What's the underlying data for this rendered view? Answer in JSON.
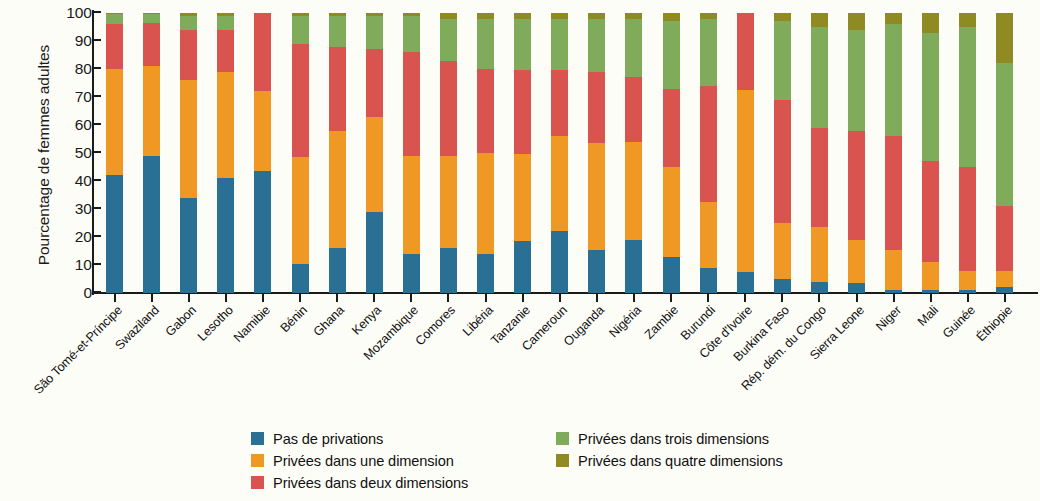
{
  "chart_data": {
    "type": "bar",
    "stacked": true,
    "title": "",
    "xlabel": "",
    "ylabel": "Pourcentage de femmes adultes",
    "ylim": [
      0,
      100
    ],
    "yticks": [
      0,
      10,
      20,
      30,
      40,
      50,
      60,
      70,
      80,
      90,
      100
    ],
    "grid": false,
    "legend_position": "bottom",
    "colors": {
      "pas_de_privations": "#2a6f94",
      "une_dimension": "#ef9824",
      "deux_dimensions": "#d9534f",
      "trois_dimensions": "#7fab5a",
      "quatre_dimensions": "#8f8a21"
    },
    "categories": [
      "São Tomé-et-Príncipe",
      "Swaziland",
      "Gabon",
      "Lesotho",
      "Namibie",
      "Bénin",
      "Ghana",
      "Kenya",
      "Mozambique",
      "Comores",
      "Libéria",
      "Tanzanie",
      "Cameroun",
      "Ouganda",
      "Nigéria",
      "Zambie",
      "Burundi",
      "Côte d'Ivoire",
      "Burkina Faso",
      "Rép. dém. du Congo",
      "Sierra Leone",
      "Niger",
      "Mali",
      "Guinée",
      "Éthiopie"
    ],
    "series": [
      {
        "name": "Pas de privations",
        "color": "#2a6f94",
        "values": [
          42,
          49,
          34,
          41,
          43.5,
          10.5,
          16,
          29,
          14,
          16,
          14,
          18.5,
          22,
          15.5,
          19,
          13,
          9,
          7.5,
          5,
          4,
          3.5,
          1,
          1,
          1,
          2
        ]
      },
      {
        "name": "Privées dans une dimension",
        "color": "#ef9824",
        "values": [
          38,
          32,
          42,
          38,
          28.5,
          38,
          42,
          34,
          35,
          33,
          36,
          31,
          34,
          38,
          35,
          32,
          23.5,
          65,
          20,
          19.5,
          15.5,
          14.5,
          10,
          7,
          6
        ]
      },
      {
        "name": "Privées dans deux dimensions",
        "color": "#d9534f",
        "values": [
          16,
          15.5,
          18,
          15,
          28,
          40.5,
          30,
          24,
          37,
          34,
          30,
          30,
          23.5,
          25.5,
          23,
          28,
          41.5,
          27.5,
          44,
          35.5,
          39,
          40.5,
          36,
          37,
          23
        ]
      },
      {
        "name": "Privées dans trois dimensions",
        "color": "#7fab5a",
        "values": [
          3.5,
          3,
          5,
          5,
          0,
          10,
          11,
          12,
          13,
          15,
          18,
          18.5,
          18.5,
          19,
          21,
          24,
          24,
          0,
          28,
          36,
          36,
          40,
          46,
          50,
          51
        ]
      },
      {
        "name": "Privées dans quatre dimensions",
        "color": "#8f8a21",
        "values": [
          0.5,
          0.5,
          1,
          1,
          0,
          1,
          1,
          1,
          1,
          2,
          2,
          2,
          2,
          2,
          2,
          3,
          2,
          0,
          3,
          5,
          6,
          4,
          7,
          5,
          18
        ]
      }
    ]
  },
  "axis": {
    "y_title": "Pourcentage de femmes adultes",
    "y_tick_labels": [
      "100",
      "90",
      "80",
      "70",
      "60",
      "50",
      "40",
      "30",
      "20",
      "10",
      "0"
    ]
  },
  "legend": {
    "left_column": [
      {
        "label": "Pas de privations",
        "color": "#2a6f94",
        "swatch_name": "legend-swatch-pas-de-privations"
      },
      {
        "label": "Privées dans une dimension",
        "color": "#ef9824",
        "swatch_name": "legend-swatch-une-dimension"
      },
      {
        "label": "Privées dans deux dimensions",
        "color": "#d9534f",
        "swatch_name": "legend-swatch-deux-dimensions"
      }
    ],
    "right_column": [
      {
        "label": "Privées dans trois dimensions",
        "color": "#7fab5a",
        "swatch_name": "legend-swatch-trois-dimensions"
      },
      {
        "label": "Privées dans quatre dimensions",
        "color": "#8f8a21",
        "swatch_name": "legend-swatch-quatre-dimensions"
      }
    ]
  }
}
